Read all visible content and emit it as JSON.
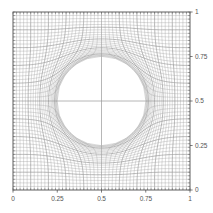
{
  "figure": {
    "kind": "structured-curvilinear-mesh-plot",
    "background_color": "#ffffff",
    "frame_color": "#4d4d4d",
    "grid_line_color": "#9a9a9a",
    "tick_color": "#5a5a5a",
    "label_color": "#555555"
  },
  "axes": {
    "plot_box_px": {
      "left": 13,
      "top": 12,
      "right": 190,
      "bottom": 190
    },
    "x": {
      "range": [
        0,
        1
      ],
      "major_ticks": [
        0,
        0.25,
        0.5,
        0.75,
        1
      ],
      "major_tick_labels": [
        "0",
        "0.25",
        "0.5",
        "0.75",
        "1"
      ],
      "minor_tick_count": 50,
      "label_side": "bottom",
      "axis_label": ""
    },
    "y": {
      "range": [
        0,
        1
      ],
      "major_ticks": [
        0,
        0.25,
        0.5,
        0.75,
        1
      ],
      "major_tick_labels": [
        "0",
        "0.25",
        "0.5",
        "0.75",
        "1"
      ],
      "minor_tick_count": 50,
      "label_side": "right",
      "axis_label": ""
    },
    "title": ""
  },
  "chart_data": {
    "type": "line",
    "title": "",
    "xlabel": "",
    "ylabel": "",
    "xlim": [
      0,
      1
    ],
    "ylim": [
      0,
      1
    ],
    "grid": false,
    "legend": "none",
    "mesh": {
      "description": "Body-fitted structured quadrilateral mesh over the unit square, deformed to wrap a circular inclusion at the centre. Grid lines bend around the circle and cluster into thin boundary layers along its perimeter; mesh is symmetric about x=0.5 and y=0.5.",
      "nx": 50,
      "ny": 50,
      "domain": [
        [
          0,
          1
        ],
        [
          0,
          1
        ]
      ],
      "inclusion": {
        "shape": "circle",
        "center": [
          0.5,
          0.5
        ],
        "radius": 0.25,
        "top": 0.75,
        "bottom": 0.25,
        "left": 0.25,
        "right": 0.75
      },
      "deformation": {
        "model": "radial-conformal-pull",
        "influence_radius": 0.52,
        "boundary_layer_clustering": 0.55,
        "symmetry": [
          "x=0.5",
          "y=0.5"
        ]
      }
    }
  }
}
